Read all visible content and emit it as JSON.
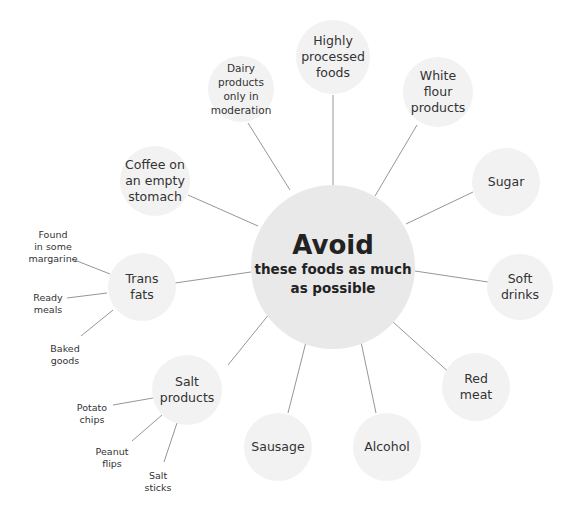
{
  "center": {
    "title": "Avoid",
    "subtitle": "these foods as much\nas possible"
  },
  "nodes": [
    {
      "id": "highly-processed-foods",
      "label": "Highly\nprocessed\nfoods"
    },
    {
      "id": "white-flour-products",
      "label": "White\nflour\nproducts"
    },
    {
      "id": "sugar",
      "label": "Sugar"
    },
    {
      "id": "soft-drinks",
      "label": "Soft\ndrinks"
    },
    {
      "id": "red-meat",
      "label": "Red\nmeat"
    },
    {
      "id": "alcohol",
      "label": "Alcohol"
    },
    {
      "id": "sausage",
      "label": "Sausage"
    },
    {
      "id": "salt-products",
      "label": "Salt\nproducts"
    },
    {
      "id": "trans-fats",
      "label": "Trans\nfats"
    },
    {
      "id": "coffee-on-an-empty-stomach",
      "label": "Coffee on\nan empty\nstomach"
    },
    {
      "id": "dairy-products",
      "label": "Dairy\nproducts\nonly in\nmoderation"
    }
  ],
  "trans_fats_leaves": [
    {
      "label": "Found\nin some\nmargarine"
    },
    {
      "label": "Ready\nmeals"
    },
    {
      "label": "Baked\ngoods"
    }
  ],
  "salt_products_leaves": [
    {
      "label": "Potato\nchips"
    },
    {
      "label": "Peanut\nflips"
    },
    {
      "label": "Salt\nsticks"
    }
  ],
  "colors": {
    "center_fill": "#e9e9e9",
    "node_fill": "#f2f2f2",
    "line": "#8a8a8a",
    "text": "#333333"
  }
}
